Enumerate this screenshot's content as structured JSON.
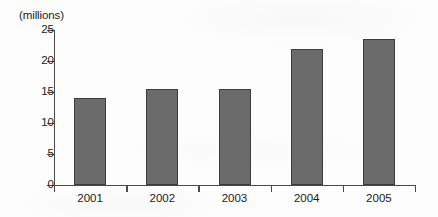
{
  "chart_data": {
    "type": "bar",
    "title": "",
    "subtitle": "",
    "xlabel": "",
    "ylabel": "(millions)",
    "categories": [
      "2001",
      "2002",
      "2003",
      "2004",
      "2005"
    ],
    "values": [
      14,
      15.5,
      15.5,
      22,
      23.5
    ],
    "series": [
      {
        "name": "",
        "values": [
          14,
          15.5,
          15.5,
          22,
          23.5
        ]
      }
    ],
    "ylim": [
      0,
      25
    ],
    "yticks": [
      0,
      5,
      10,
      15,
      20,
      25
    ],
    "ytick_labels": [
      "0",
      "5",
      "10",
      "15",
      "20",
      "25"
    ],
    "xtick_labels": [
      "2001",
      "2002",
      "2003",
      "2004",
      "2005"
    ],
    "grid": false,
    "legend": null,
    "legend_position": "none",
    "annotations": [],
    "colors": {
      "bar_fill": "#6b6b6b",
      "bar_stroke": "#3c3c3c",
      "axis": "#4a4a4a",
      "text": "#1b1b1b",
      "background": "#fdfdfd"
    }
  }
}
